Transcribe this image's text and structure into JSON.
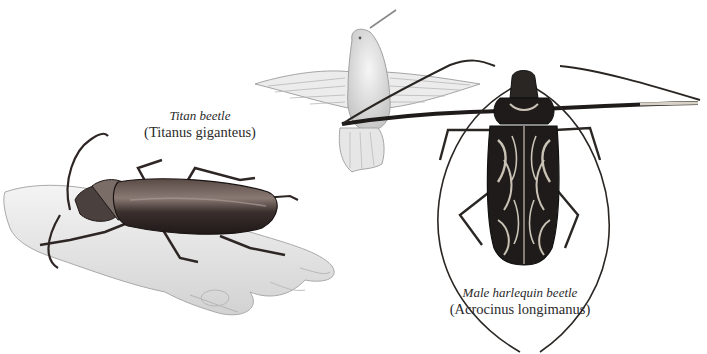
{
  "plate": {
    "subjects": [
      {
        "id": "titan",
        "common_name": "Titan beetle",
        "scientific_name": "(Titanus giganteus)",
        "depiction": "beetle resting on human hand"
      },
      {
        "id": "hummingbird",
        "depiction": "hummingbird in flight, for scale"
      },
      {
        "id": "harlequin",
        "common_name": "Male harlequin beetle",
        "scientific_name": "(Acrocinus longimanus)",
        "depiction": "patterned long-armed beetle, dorsal view"
      }
    ],
    "colors": {
      "background": "#ffffff",
      "ink": "#2a2a2a",
      "titan_body": "#3a2f2c",
      "harlequin_dark": "#1e1b1a",
      "harlequin_pattern": "#c9c2b5",
      "hand_shade": "#d8d8d8"
    }
  }
}
